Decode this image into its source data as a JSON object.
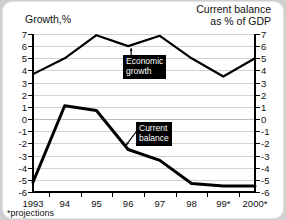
{
  "titles": {
    "left_axis": "Growth,%",
    "right_axis_line1": "Current balance",
    "right_axis_line2": "as % of GDP"
  },
  "footnote": "*projections",
  "callouts": {
    "growth_line1": "Economic",
    "growth_line2": "growth",
    "balance_line1": "Current",
    "balance_line2": "balance"
  },
  "colors": {
    "line": "#000000",
    "grid": "#d2d2d2",
    "axis": "#000000",
    "callout_bg": "#000000",
    "callout_text": "#ffffff",
    "card_bg": "#ffffff",
    "page_bg": "#cfcfcf"
  },
  "chart_data": {
    "type": "line",
    "title": "",
    "xlabel": "",
    "ylabel": "Growth,%",
    "y2label": "Current balance as % of GDP",
    "categories": [
      "1993",
      "94",
      "95",
      "96",
      "97",
      "98",
      "99*",
      "2000*"
    ],
    "ylim": [
      -6,
      7
    ],
    "y2lim": [
      -6,
      7
    ],
    "yticks": [
      7,
      6,
      5,
      4,
      3,
      2,
      1,
      0,
      -1,
      -2,
      -3,
      -4,
      -5,
      -6
    ],
    "ytick_labels": [
      "7",
      "6",
      "5",
      "4",
      "3",
      "2",
      "1",
      "0",
      "-1",
      "-2",
      "-3",
      "-4",
      "-5",
      "-6"
    ],
    "y2ticks": [
      7,
      6,
      5,
      4,
      3,
      2,
      1,
      0,
      -1,
      -2,
      -3,
      -4,
      -5,
      -6
    ],
    "y2tick_labels": [
      "7",
      "6",
      "5",
      "4",
      "3",
      "2",
      "1",
      "0",
      "-1",
      "-2",
      "-3",
      "-4",
      "-5",
      "-6"
    ],
    "grid": true,
    "grid_axis": "y",
    "legend": "annotations",
    "series": [
      {
        "name": "Economic growth",
        "axis": "left",
        "values": [
          3.7,
          5.0,
          6.9,
          6.0,
          6.85,
          5.0,
          3.5,
          5.0
        ]
      },
      {
        "name": "Current balance",
        "axis": "right",
        "values": [
          -5.2,
          1.1,
          0.7,
          -2.5,
          -3.4,
          -5.3,
          -5.5,
          -5.5
        ]
      }
    ],
    "annotations": [
      {
        "text": "Economic growth",
        "points_to_series": "Economic growth",
        "points_to_x": "96"
      },
      {
        "text": "Current balance",
        "points_to_series": "Current balance",
        "points_to_x": "96"
      }
    ]
  }
}
